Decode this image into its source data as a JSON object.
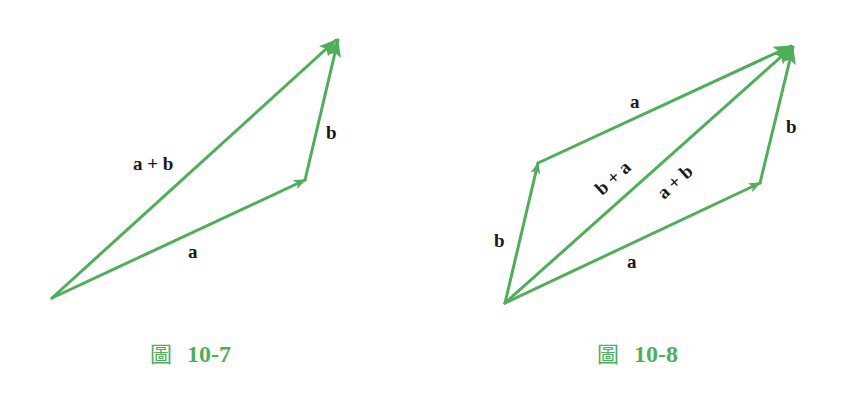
{
  "colors": {
    "vector": "#4fae5a",
    "label": "#1a1a1a",
    "caption": "#4fae5a",
    "background": "#ffffff"
  },
  "figures": [
    {
      "id": "fig-10-7",
      "caption": {
        "prefix": "圖",
        "number": "10-7"
      },
      "description": "Triangle rule for vector addition",
      "vectors": [
        {
          "name": "a",
          "label": "a",
          "from": [
            52,
            298
          ],
          "to": [
            305,
            180
          ]
        },
        {
          "name": "b",
          "label": "b",
          "from": [
            305,
            180
          ],
          "to": [
            338,
            38
          ]
        },
        {
          "name": "a+b",
          "label": "a + b",
          "from": [
            52,
            298
          ],
          "to": [
            338,
            38
          ]
        }
      ],
      "labels": {
        "sum": "a + b",
        "a": "a",
        "b": "b"
      }
    },
    {
      "id": "fig-10-8",
      "caption": {
        "prefix": "圖",
        "number": "10-8"
      },
      "description": "Parallelogram rule showing commutativity a+b = b+a",
      "vectors": [
        {
          "name": "a-bottom",
          "label": "a",
          "from": [
            505,
            303
          ],
          "to": [
            760,
            183
          ]
        },
        {
          "name": "b-right",
          "label": "b",
          "from": [
            760,
            183
          ],
          "to": [
            793,
            45
          ]
        },
        {
          "name": "b-left",
          "label": "b",
          "from": [
            505,
            303
          ],
          "to": [
            538,
            163
          ]
        },
        {
          "name": "a-top",
          "label": "a",
          "from": [
            538,
            163
          ],
          "to": [
            793,
            45
          ]
        },
        {
          "name": "diagonal",
          "label": "a + b / b + a",
          "from": [
            505,
            303
          ],
          "to": [
            793,
            45
          ]
        }
      ],
      "labels": {
        "a_top": "a",
        "b_right": "b",
        "b_left": "b",
        "a_bottom": "a",
        "b_plus_a": "b + a",
        "a_plus_b": "a + b"
      }
    }
  ]
}
